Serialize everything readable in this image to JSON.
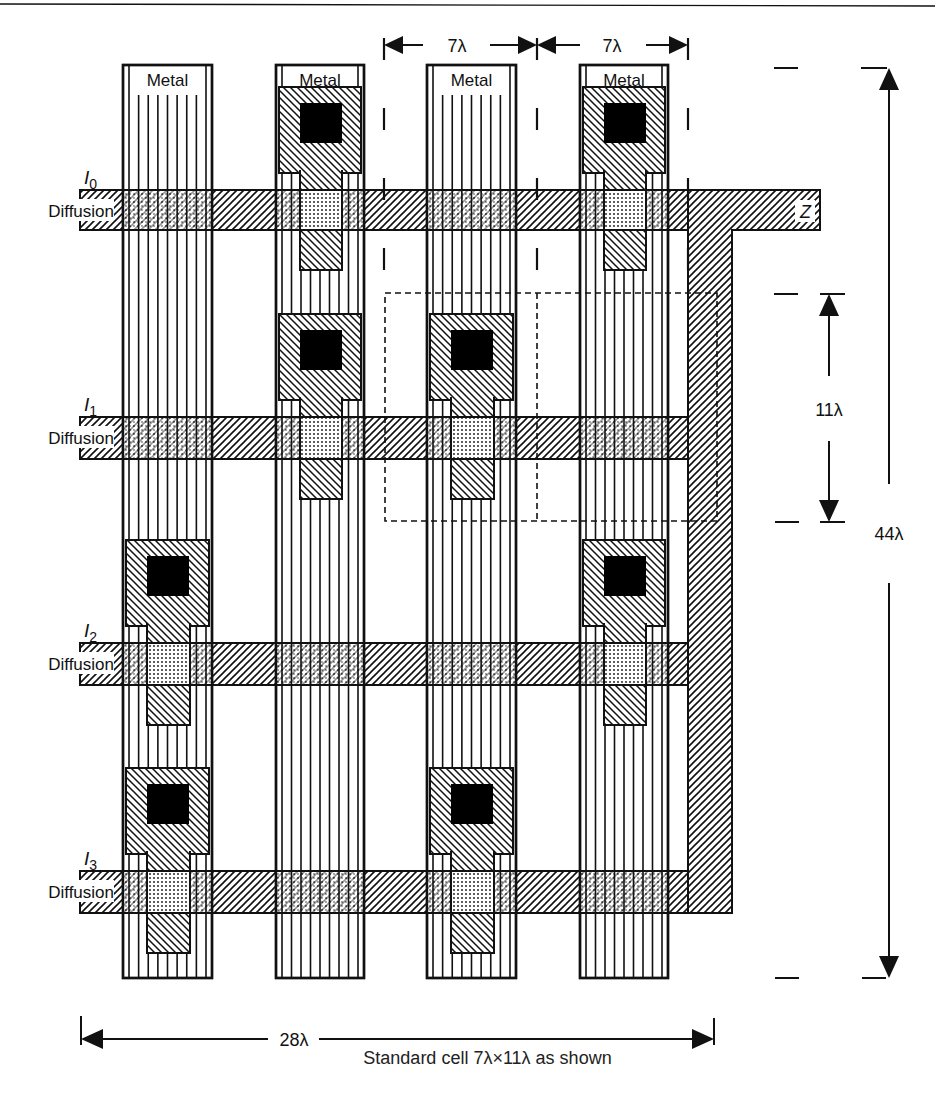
{
  "figure": {
    "header_fragment": "...y ... g ... y",
    "caption": "Standard cell 7λ×11λ as shown",
    "colors": {
      "ink": "#111111",
      "paper": "#ffffff"
    }
  },
  "layers": {
    "metal_label": "Metal",
    "diffusion_label": "Diffusion",
    "output_label": "Z"
  },
  "metal_columns": [
    {
      "id": "m1",
      "label": "Metal",
      "x": 123,
      "w": 89
    },
    {
      "id": "m2",
      "label": "Metal",
      "x": 276,
      "w": 88
    },
    {
      "id": "m3",
      "label": "Metal",
      "x": 427,
      "w": 89
    },
    {
      "id": "m4",
      "label": "Metal",
      "x": 580,
      "w": 88
    }
  ],
  "diffusion_rows": [
    {
      "id": "I0",
      "input": "I",
      "sub": "0",
      "label": "Diffusion",
      "y": 190,
      "h": 40
    },
    {
      "id": "I1",
      "input": "I",
      "sub": "1",
      "label": "Diffusion",
      "y": 417,
      "h": 42
    },
    {
      "id": "I2",
      "input": "I",
      "sub": "2",
      "label": "Diffusion",
      "y": 643,
      "h": 42
    },
    {
      "id": "I3",
      "input": "I",
      "sub": "3",
      "label": "Diffusion",
      "y": 871,
      "h": 42
    }
  ],
  "contacts": [
    {
      "column": "m2",
      "row": "I0"
    },
    {
      "column": "m4",
      "row": "I0"
    },
    {
      "column": "m2",
      "row": "I1"
    },
    {
      "column": "m3",
      "row": "I1"
    },
    {
      "column": "m1",
      "row": "I2"
    },
    {
      "column": "m4",
      "row": "I2"
    },
    {
      "column": "m1",
      "row": "I3"
    },
    {
      "column": "m3",
      "row": "I3"
    }
  ],
  "dimensions": {
    "top_left": "7λ",
    "top_right": "7λ",
    "right_cell_height": "11λ",
    "right_total_height": "44λ",
    "bottom_total_width": "28λ"
  },
  "standard_cell": {
    "width": "7λ",
    "height": "11λ"
  }
}
